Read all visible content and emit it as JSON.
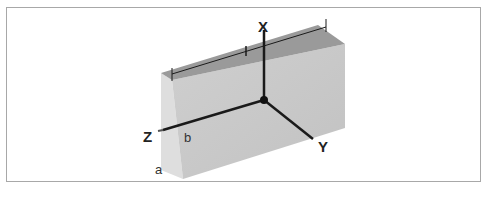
{
  "figure": {
    "axes": {
      "x": {
        "label": "X",
        "direction": "up"
      },
      "y": {
        "label": "Y",
        "direction": "right-down"
      },
      "z": {
        "label": "Z",
        "direction": "left-down"
      }
    },
    "dimensions": {
      "length": "l",
      "width": "b",
      "height": "a"
    },
    "colors": {
      "top_face": "#9a9a9a",
      "front_face": "#c9c9c9",
      "side_face": "#dedede",
      "axis_line": "#1a1a1a",
      "frame_border": "#a8a8a8"
    }
  }
}
